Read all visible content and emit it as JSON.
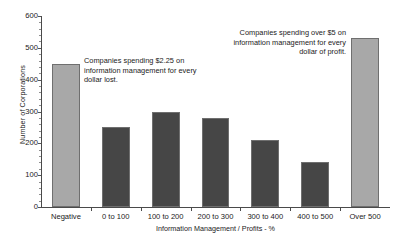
{
  "chart_data": {
    "type": "bar",
    "title": "",
    "xlabel": "Information Management / Profits  - %",
    "ylabel": "Number of Corporations",
    "categories": [
      "Negative",
      "0 to 100",
      "100 to 200",
      "200 to 300",
      "300 to 400",
      "400 to 500",
      "Over 500"
    ],
    "values": [
      450,
      250,
      300,
      280,
      210,
      140,
      530
    ],
    "ylim": [
      0,
      600
    ],
    "ytick_labels": [
      "0",
      "100",
      "200",
      "300",
      "400",
      "500",
      "600"
    ],
    "ytick_values": [
      0,
      100,
      200,
      300,
      400,
      500,
      600
    ],
    "grid": false,
    "legend": "none",
    "bar_colors": [
      "#a8a8a8",
      "#464646",
      "#464646",
      "#464646",
      "#464646",
      "#464646",
      "#a8a8a8"
    ],
    "bar_border_color": "#6f6f6f",
    "annotations": [
      {
        "id": "annotation-left",
        "text": "Companies spending $2.25 on information management for every dollar lost.",
        "target_category": "Negative",
        "align": "left"
      },
      {
        "id": "annotation-right",
        "text": "Companies spending over $5 on information management for every dollar of profit.",
        "target_category": "Over 500",
        "align": "right"
      }
    ]
  },
  "axes": {
    "y_title": "Number of Corporations",
    "x_title": "Information Management / Profits  - %"
  },
  "annotations": {
    "left": "Companies spending $2.25 on information management for every dollar lost.",
    "right": "Companies spending over $5 on information management for every dollar of profit."
  }
}
